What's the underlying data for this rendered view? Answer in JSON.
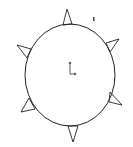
{
  "drawing": {
    "background": "#ffffff",
    "stroke": "#222222",
    "ellipse": {
      "cx": 70,
      "cy": 75,
      "rx": 45,
      "ry": 51
    },
    "spikes": [
      {
        "name": "top",
        "points": "63,25 67,9 72,24"
      },
      {
        "name": "upper-left",
        "points": "31,49 17,45 27,58"
      },
      {
        "name": "upper-right",
        "points": "106,43 119,39 110,52"
      },
      {
        "name": "lower-left",
        "points": "29,98 21,112 35,109"
      },
      {
        "name": "lower-right",
        "points": "110,92 122,105 109,102"
      },
      {
        "name": "bottom",
        "points": "68,126 73,142 78,126"
      }
    ],
    "origin_marker": {
      "x": 70,
      "y": 74
    },
    "small_mark": {
      "x": 93,
      "y": 17
    }
  }
}
